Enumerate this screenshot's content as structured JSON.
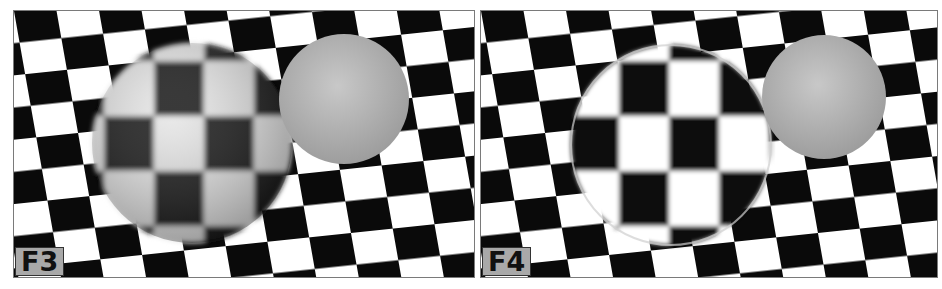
{
  "figure": {
    "panels": [
      {
        "id": "F3",
        "label": "F3",
        "description": "Checkerboard plane with opaque diffuse sphere showing blurred checker reflection and a plain gray sphere"
      },
      {
        "id": "F4",
        "label": "F4",
        "description": "Checkerboard plane with glass-like transparent sphere showing refracted checker pattern and a plain gray sphere"
      }
    ],
    "colors": {
      "checker_dark": "#0a0a0a",
      "checker_light": "#ffffff",
      "sphere_gray": "#b8b8b8",
      "label_bg": "#a9a9a9"
    }
  }
}
